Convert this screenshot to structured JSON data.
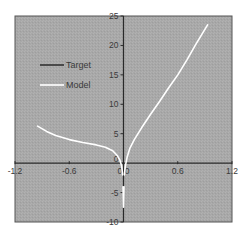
{
  "chart_data": {
    "type": "line",
    "title": "",
    "xlabel": "",
    "ylabel": "",
    "xlim": [
      -1.2,
      1.2
    ],
    "ylim": [
      -10,
      25
    ],
    "grid": false,
    "legend_position": "upper-left (inside plot)",
    "x_ticks": [
      "-1.2",
      "-0.6",
      "0.0",
      "0.6",
      "1.2"
    ],
    "x_tick_values": [
      -1.2,
      -0.6,
      0.0,
      0.6,
      1.2
    ],
    "y_ticks": [
      "25",
      "20",
      "15",
      "10",
      "5",
      "0",
      "-5",
      "-10"
    ],
    "y_tick_values": [
      25,
      20,
      15,
      10,
      5,
      0,
      -5,
      -10
    ],
    "colors": {
      "plot_background": "#a9a9a9",
      "axis_line": "#2a2a2a",
      "frame": "#555555",
      "target": "#333333",
      "model": "#ffffff"
    },
    "series": [
      {
        "name": "Target",
        "color": "#333333",
        "x": [],
        "y": []
      },
      {
        "name": "Model",
        "color": "#ffffff",
        "segments": [
          {
            "x": [
              -0.95,
              -0.85,
              -0.75,
              -0.6,
              -0.45,
              -0.3,
              -0.2,
              -0.12,
              -0.07,
              -0.04,
              -0.02,
              -0.01
            ],
            "y": [
              6.3,
              5.4,
              4.7,
              4.0,
              3.5,
              3.1,
              2.7,
              2.1,
              1.3,
              0.5,
              -0.5,
              -2.0
            ]
          },
          {
            "x": [
              -0.005,
              0.0,
              0.005
            ],
            "y": [
              -4.0,
              -7.5,
              -4.0
            ]
          },
          {
            "x": [
              0.01,
              0.02,
              0.04,
              0.07,
              0.12,
              0.2,
              0.3,
              0.4,
              0.5,
              0.6,
              0.7,
              0.8,
              0.93
            ],
            "y": [
              -2.0,
              -0.5,
              1.0,
              2.5,
              4.0,
              6.0,
              8.3,
              10.5,
              12.8,
              15.0,
              17.5,
              20.2,
              23.5
            ]
          }
        ]
      }
    ]
  },
  "legend": {
    "items": [
      {
        "label": "Target",
        "color": "#333333"
      },
      {
        "label": "Model",
        "color": "#ffffff"
      }
    ]
  }
}
